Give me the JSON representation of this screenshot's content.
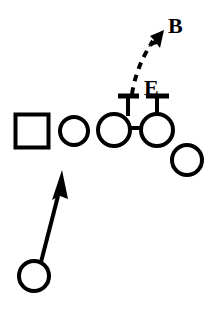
{
  "diagram": {
    "type": "football-play-diagram",
    "background_color": "#ffffff",
    "ink_color": "#000000",
    "width": 213,
    "height": 309,
    "labels": [
      {
        "id": "label-b",
        "text": "B",
        "x": 168,
        "y": 25,
        "font_size": 21,
        "meaning": "backer"
      },
      {
        "id": "label-e",
        "text": "E",
        "x": 146,
        "y": 88,
        "font_size": 21,
        "meaning": "end"
      }
    ],
    "offense_line": {
      "name": "offensive-line",
      "players": [
        {
          "id": "player-square-left",
          "shape": "square",
          "cx": 32,
          "cy": 131,
          "size": 33,
          "stroke_width": 4
        },
        {
          "id": "player-circle-2",
          "shape": "circle",
          "cx": 74,
          "cy": 131,
          "r": 14,
          "stroke_width": 4
        },
        {
          "id": "player-circle-3",
          "shape": "circle",
          "cx": 114,
          "cy": 130,
          "r": 16,
          "stroke_width": 4
        },
        {
          "id": "player-circle-4",
          "shape": "circle",
          "cx": 157,
          "cy": 130,
          "r": 16,
          "stroke_width": 4
        },
        {
          "id": "player-circle-5",
          "shape": "circle",
          "cx": 187,
          "cy": 160,
          "r": 15,
          "stroke_width": 4
        }
      ]
    },
    "backfield": {
      "name": "backfield",
      "players": [
        {
          "id": "player-circle-back",
          "shape": "circle",
          "cx": 34,
          "cy": 276,
          "r": 15,
          "stroke_width": 4
        }
      ]
    },
    "routes": [
      {
        "id": "route-ballcarrier",
        "style": "solid",
        "stroke_width": 4,
        "from": "player-circle-back",
        "points": [
          [
            41,
            262
          ],
          [
            60,
            190
          ]
        ],
        "arrow": {
          "tip": [
            63,
            170
          ],
          "half_width": 9,
          "length": 26
        }
      },
      {
        "id": "route-pull-block-dashed",
        "style": "dashed",
        "stroke_width": 4,
        "dash": "7 5",
        "from": "player-circle-4",
        "points": [
          [
            133,
            93
          ],
          [
            139,
            70
          ],
          [
            146,
            48
          ],
          [
            152,
            40
          ]
        ],
        "arrow": {
          "tip": [
            163,
            32
          ],
          "half_width": 7,
          "length": 18
        }
      }
    ],
    "blocks": [
      {
        "id": "block-stem-left",
        "style": "t-block",
        "stroke_width": 4,
        "stem": [
          [
            128,
            114
          ],
          [
            128,
            96
          ]
        ],
        "cap": [
          [
            119,
            96
          ],
          [
            139,
            96
          ]
        ]
      },
      {
        "id": "block-stem-right",
        "style": "t-block",
        "stroke_width": 4,
        "stem": [
          [
            157,
            114
          ],
          [
            157,
            96
          ]
        ],
        "cap": [
          [
            146,
            96
          ],
          [
            168,
            96
          ]
        ]
      }
    ],
    "connectors": [
      {
        "id": "connector-line-3-4",
        "stroke_width": 4,
        "points": [
          [
            130,
            128
          ],
          [
            141,
            128
          ]
        ]
      }
    ]
  }
}
